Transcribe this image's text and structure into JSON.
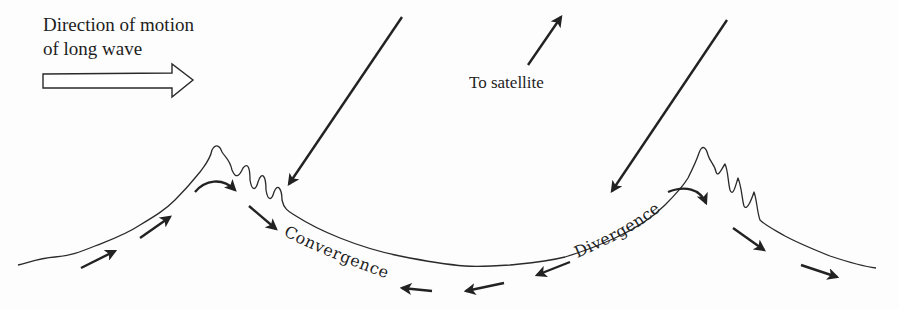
{
  "figure": {
    "labels": {
      "direction_line1": "Direction of motion",
      "direction_line2": "of long wave",
      "to_satellite": "To satellite",
      "convergence": "Convergence",
      "divergence": "Divergence"
    },
    "icons": {
      "direction_arrow": "hollow-right-arrow",
      "incident_rays": "down-left-arrow",
      "satellite_ray": "up-right-arrow",
      "flow_arrows": "small-solid-arrows"
    },
    "colors": {
      "ink": "#222222",
      "background": "#fdfdfd"
    }
  }
}
